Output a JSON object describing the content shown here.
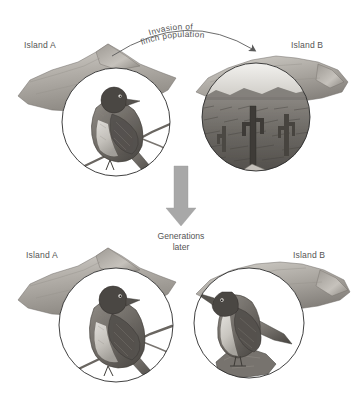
{
  "figure": {
    "type": "evolution-diagram",
    "background_color": "#ffffff",
    "ink_color": "#555555",
    "arrow_color": "#a0a0a0"
  },
  "top_row": {
    "island_a_label": "Island A",
    "island_b_label": "Island B",
    "island_a_circle": {
      "content": "finch perched on branch",
      "icon": "finch-perched-illustration"
    },
    "island_b_circle": {
      "content": "arid cactus landscape",
      "icon": "cactus-landscape-illustration"
    }
  },
  "invasion_arrow": {
    "line1": "Invasion of",
    "line2": "finch population",
    "direction": "left-to-right",
    "icon": "curved-arrow-icon"
  },
  "generations_arrow": {
    "line1": "Generations",
    "line2": "later",
    "direction": "downward",
    "color": "#a0a0a0",
    "icon": "down-arrow-icon"
  },
  "bottom_row": {
    "island_a_label": "Island A",
    "island_b_label": "Island B",
    "island_a_circle": {
      "content": "finch perched on branch with short stout beak",
      "icon": "finch-short-beak-illustration"
    },
    "island_b_circle": {
      "content": "finch standing on rock with long pointed beak",
      "icon": "finch-long-beak-illustration"
    }
  }
}
